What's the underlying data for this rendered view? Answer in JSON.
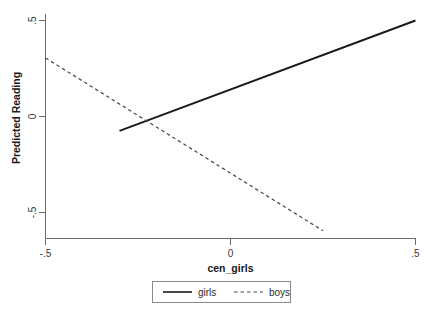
{
  "chart_data": {
    "type": "line",
    "title": "",
    "xlabel": "cen_girls",
    "ylabel": "Predicted Reading",
    "xlim": [
      -0.5,
      0.5
    ],
    "ylim": [
      -0.5,
      0.5
    ],
    "xticks": [
      -0.5,
      0,
      0.5
    ],
    "xticklabels": [
      "-.5",
      "0",
      ".5"
    ],
    "yticks": [
      -0.5,
      0,
      0.5
    ],
    "yticklabels": [
      "-.5",
      "0",
      ".5"
    ],
    "grid": false,
    "legend_position": "below-center",
    "series": [
      {
        "name": "girls",
        "style": "solid",
        "color": "#1a1a1a",
        "x": [
          -0.3,
          0.5
        ],
        "y": [
          -0.075,
          0.5
        ]
      },
      {
        "name": "boys",
        "style": "dashed",
        "color": "#4a4a4a",
        "x": [
          -0.5,
          0.25
        ],
        "y": [
          0.305,
          -0.595
        ]
      }
    ]
  },
  "axis": {
    "x_title": "cen_girls",
    "y_title": "Predicted Reading",
    "x_tick_labels": [
      "-.5",
      "0",
      ".5"
    ],
    "y_tick_labels": [
      ".5",
      "0",
      "-.5"
    ]
  },
  "legend": {
    "entries": [
      {
        "label": "girls",
        "style": "solid"
      },
      {
        "label": "boys",
        "style": "dashed"
      }
    ]
  },
  "colors": {
    "axis": "#6a6a6a",
    "girls_line": "#1a1a1a",
    "boys_line": "#4a4a4a",
    "legend_border": "#8a8a8a",
    "background": "#ffffff"
  }
}
